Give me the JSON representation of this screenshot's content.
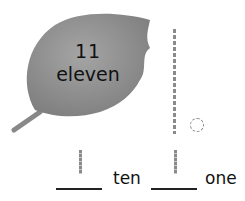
{
  "leaf": {
    "number": "11",
    "word": "eleven",
    "color": "#8f8f8f"
  },
  "model": {
    "tens_rod_count": 1,
    "ones_cube_count": 1
  },
  "answer": {
    "tens_label": "ten",
    "ones_label": "one",
    "tens_written": "1",
    "ones_written": "1"
  }
}
